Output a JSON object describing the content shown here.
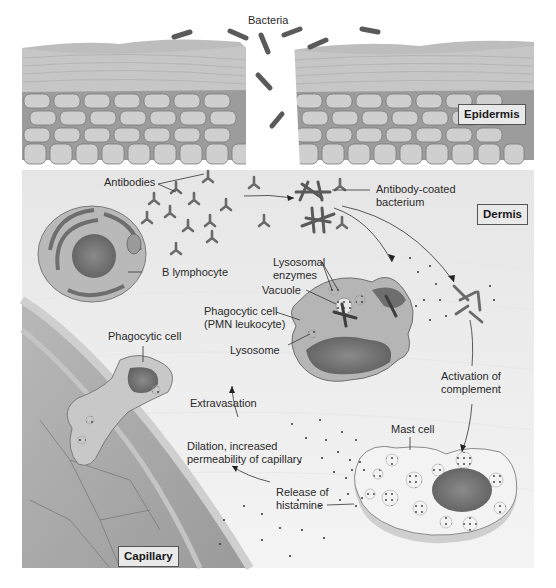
{
  "diagram": {
    "regions": {
      "epidermis": "Epidermis",
      "dermis": "Dermis",
      "capillary": "Capillary"
    },
    "labels": {
      "bacteria": "Bacteria",
      "antibodies": "Antibodies",
      "antibody_coated_bacterium": "Antibody-coated\nbacterium",
      "b_lymphocyte": "B lymphocyte",
      "lysosomal_enzymes": "Lysosomal\nenzymes",
      "vacuole": "Vacuole",
      "phagocytic_cell_pmn": "Phagocytic cell\n(PMN leukocyte)",
      "lysosome": "Lysosome",
      "phagocytic_cell": "Phagocytic cell",
      "extravasation": "Extravasation",
      "dilation": "Dilation, increased\npermeability of capillary",
      "activation_of_complement": "Activation of\ncomplement",
      "mast_cell": "Mast cell",
      "release_of_histamine": "Release of\nhistamine"
    },
    "colors": {
      "tissue_gray": "#8a8a8a",
      "dark_gray": "#5a5a5a",
      "light_gray": "#d8d8d8",
      "background": "#f2f2f2",
      "text": "#2a2a2a"
    }
  }
}
